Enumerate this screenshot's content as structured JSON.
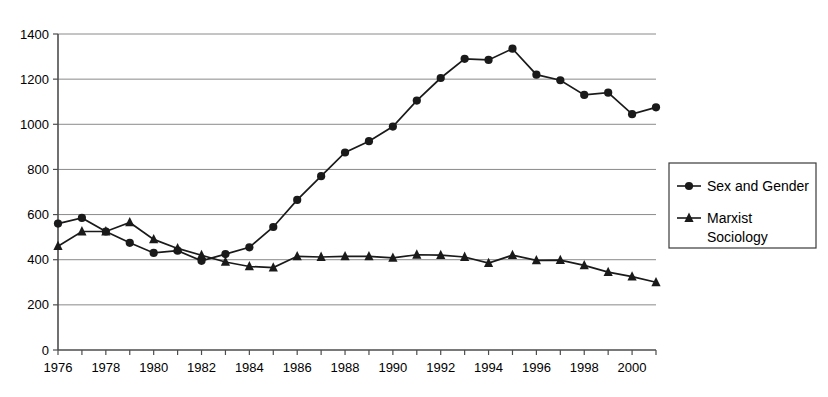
{
  "chart_data": {
    "type": "line",
    "title": "",
    "subtitle": "",
    "xlabel": "",
    "ylabel": "",
    "x": [
      1976,
      1977,
      1978,
      1979,
      1980,
      1981,
      1982,
      1983,
      1984,
      1985,
      1986,
      1987,
      1988,
      1989,
      1990,
      1991,
      1992,
      1993,
      1994,
      1995,
      1996,
      1997,
      1998,
      1999,
      2000,
      2001
    ],
    "xlim": [
      1976,
      2001
    ],
    "ylim": [
      0,
      1400
    ],
    "x_tick_labels": [
      "1976",
      "1978",
      "1980",
      "1982",
      "1984",
      "1986",
      "1988",
      "1990",
      "1992",
      "1994",
      "1996",
      "1998",
      "2000"
    ],
    "x_tick_values": [
      1976,
      1978,
      1980,
      1982,
      1984,
      1986,
      1988,
      1990,
      1992,
      1994,
      1996,
      1998,
      2000
    ],
    "x_minor_tick_values": [
      1977,
      1979,
      1981,
      1983,
      1985,
      1987,
      1989,
      1991,
      1993,
      1995,
      1997,
      1999,
      2001
    ],
    "y_tick_labels": [
      "0",
      "200",
      "400",
      "600",
      "800",
      "1000",
      "1200",
      "1400"
    ],
    "y_tick_values": [
      0,
      200,
      400,
      600,
      800,
      1000,
      1200,
      1400
    ],
    "grid": true,
    "grid_axis": "y",
    "legend_position": "right-outside",
    "series": [
      {
        "name": "Sex and Gender",
        "marker": "circle",
        "color": "#1a1a1a",
        "values": [
          560,
          585,
          525,
          475,
          430,
          440,
          395,
          425,
          455,
          545,
          665,
          770,
          875,
          925,
          990,
          1105,
          1205,
          1290,
          1285,
          1335,
          1220,
          1195,
          1130,
          1140,
          1045,
          1075
        ]
      },
      {
        "name": "Marxist Sociology",
        "marker": "triangle",
        "color": "#1a1a1a",
        "values": [
          460,
          525,
          525,
          565,
          490,
          450,
          420,
          390,
          370,
          365,
          415,
          412,
          415,
          415,
          408,
          422,
          420,
          412,
          385,
          420,
          397,
          398,
          375,
          345,
          325,
          300
        ]
      }
    ]
  },
  "legend": {
    "entries": [
      {
        "label": "Sex and Gender",
        "marker": "circle"
      },
      {
        "label_line1": "Marxist",
        "label_line2": "Sociology",
        "marker": "triangle"
      }
    ]
  }
}
